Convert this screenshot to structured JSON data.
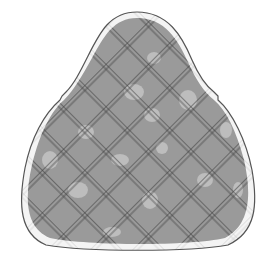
{
  "figure": {
    "colors": {
      "background": "#ffffff",
      "outline": "#555555",
      "fill": "#9a9a9a",
      "hatch": "#3a3a3a",
      "spot": "#c8c8c8",
      "margin": "#f2f2f2"
    },
    "hatch_spacing": 30,
    "hatch_angle_deg": 45
  }
}
